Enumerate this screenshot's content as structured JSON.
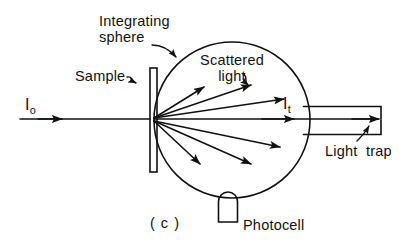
{
  "figure": {
    "caption": "( c )",
    "domain_kind": "optical-schematic",
    "background_color": "#ffffff",
    "ink_color": "#111111"
  },
  "labels": {
    "integrating_sphere": "Integrating\nsphere",
    "scattered_light": "Scattered\nlight",
    "sample": "Sample",
    "light_trap": "Light  trap",
    "photocell": "Photocell",
    "incident_beam_symbol": "I",
    "incident_beam_subscript": "o",
    "transmitted_beam_symbol": "I",
    "transmitted_beam_subscript": "t"
  },
  "components": {
    "sphere": {
      "name": "integrating-sphere",
      "shape": "circle",
      "cx": 232,
      "cy": 120,
      "r": 78,
      "stroke_width": 1.6
    },
    "sample": {
      "name": "sample-slab",
      "shape": "rectangle",
      "x": 150,
      "y": 68,
      "width": 7,
      "height": 104,
      "stroke_width": 1.6
    },
    "photocell": {
      "name": "photocell",
      "shape": "rounded-top-rectangle",
      "x": 218,
      "y": 192,
      "width": 19,
      "height": 30,
      "stroke_width": 1.6
    },
    "light_trap": {
      "name": "light-trap",
      "shape": "horizontal-tube",
      "x_start": 300,
      "x_end": 381,
      "y_top": 104,
      "y_bottom": 136,
      "stroke_width": 1.6
    },
    "incident_beam": {
      "name": "incident-beam-arrow",
      "x_start": 20,
      "x_end": 150,
      "y": 119,
      "arrowhead_x": 62
    },
    "transmitted_beam": {
      "name": "transmitted-beam-arrow",
      "x_start": 154,
      "x_end": 378,
      "y": 119,
      "arrowhead_x": 294
    }
  },
  "scattered_rays": {
    "origin_x": 154,
    "origin_y": 119,
    "count": 6,
    "endpoints": [
      {
        "id": "ray-up-1",
        "x": 205,
        "y": 86
      },
      {
        "id": "ray-up-2",
        "x": 252,
        "y": 84
      },
      {
        "id": "ray-up-3",
        "x": 285,
        "y": 98
      },
      {
        "id": "ray-down-1",
        "x": 281,
        "y": 148
      },
      {
        "id": "ray-down-2",
        "x": 252,
        "y": 165
      },
      {
        "id": "ray-down-3",
        "x": 201,
        "y": 165
      }
    ]
  },
  "pointers": [
    {
      "id": "pointer-integrating-sphere",
      "from_label": "integrating_sphere",
      "to_component": "sphere",
      "style": "curved-arrow"
    },
    {
      "id": "pointer-scattered-light",
      "from_label": "scattered_light",
      "to_component": "scattered_rays",
      "style": "squiggle-arrow"
    },
    {
      "id": "pointer-sample",
      "from_label": "sample",
      "to_component": "sample",
      "style": "squiggle-arrow"
    },
    {
      "id": "pointer-light-trap",
      "from_label": "light_trap",
      "to_component": "light_trap",
      "style": "curved-arrow"
    }
  ]
}
